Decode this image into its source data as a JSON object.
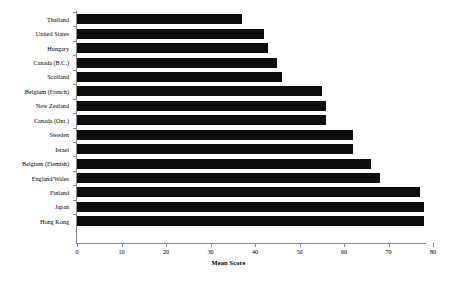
{
  "chart_data": {
    "type": "bar",
    "orientation": "horizontal",
    "title": "",
    "subtitle": "",
    "xlabel": "Mean Score",
    "ylabel": "",
    "xlim": [
      0,
      80
    ],
    "xticks": [
      0,
      10,
      20,
      30,
      40,
      50,
      60,
      70,
      80
    ],
    "xtick_labels": [
      "0",
      "10",
      "20",
      "30",
      "40",
      "50",
      "60",
      "70",
      "80"
    ],
    "grid": false,
    "legend": false,
    "legend_position": "none",
    "bar_color": "#0d0d0d",
    "axis_color": "#8c8c8c",
    "categories": [
      "Thailand",
      "United States",
      "Hungary",
      "Canada (B.C.)",
      "Scotland",
      "Belgium (French)",
      "New Zealand",
      "Canada (Ont.)",
      "Sweden",
      "Israel",
      "Belgium (Flemish)",
      "England/Wales",
      "Finland",
      "Japan",
      "Hong Kong"
    ],
    "values": [
      37,
      42,
      43,
      45,
      46,
      55,
      56,
      56,
      62,
      62,
      66,
      68,
      77,
      78,
      78
    ],
    "series": [
      {
        "name": "Mean Score",
        "values": [
          37,
          42,
          43,
          45,
          46,
          55,
          56,
          56,
          62,
          62,
          66,
          68,
          77,
          78,
          78
        ]
      }
    ]
  }
}
